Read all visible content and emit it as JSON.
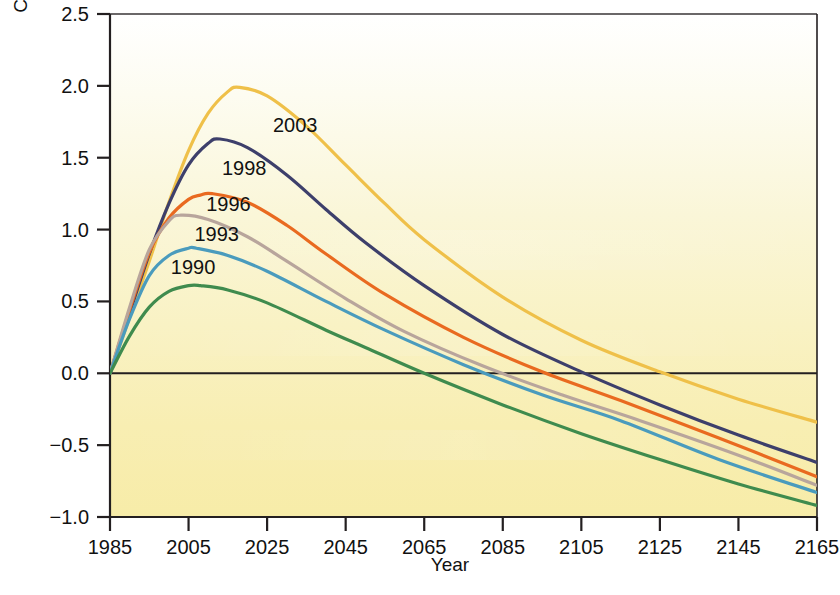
{
  "chart_data": {
    "type": "line",
    "title": "",
    "xlabel": "Year",
    "ylabel": "Concentration (parts per million)",
    "xlim": [
      1985,
      2165
    ],
    "ylim": [
      -1.0,
      2.5
    ],
    "grid": false,
    "legend_position": "inline-labels",
    "x_ticks": [
      "1985",
      "2005",
      "2025",
      "2045",
      "2065",
      "2085",
      "2105",
      "2125",
      "2145",
      "2165"
    ],
    "x_tick_values": [
      1985,
      2005,
      2025,
      2045,
      2065,
      2085,
      2105,
      2125,
      2145,
      2165
    ],
    "y_ticks": [
      "2.5",
      "2.0",
      "1.5",
      "1.0",
      "0.5",
      "0.0",
      "−0.5",
      "−1.0"
    ],
    "y_tick_values": [
      2.5,
      2.0,
      1.5,
      1.0,
      0.5,
      0.0,
      -0.5,
      -1.0
    ],
    "zero_line": 0.0,
    "series": [
      {
        "name": "2003",
        "label": "2003",
        "color": "#efc049",
        "peak_year": 2018,
        "peak_value": 1.99,
        "end_value": -0.34,
        "x": [
          1985,
          1990,
          1995,
          2000,
          2005,
          2010,
          2015,
          2018,
          2025,
          2035,
          2045,
          2055,
          2065,
          2085,
          2105,
          2125,
          2145,
          2165
        ],
        "values": [
          0.0,
          0.39,
          0.78,
          1.19,
          1.55,
          1.81,
          1.96,
          1.99,
          1.93,
          1.72,
          1.45,
          1.18,
          0.93,
          0.53,
          0.23,
          0.01,
          -0.18,
          -0.34
        ]
      },
      {
        "name": "1998",
        "label": "1998",
        "color": "#3d3f6b",
        "peak_year": 2013,
        "peak_value": 1.63,
        "end_value": -0.62,
        "x": [
          1985,
          1990,
          1995,
          2000,
          2005,
          2010,
          2013,
          2020,
          2030,
          2040,
          2050,
          2065,
          2085,
          2105,
          2125,
          2145,
          2165
        ],
        "values": [
          0.0,
          0.42,
          0.83,
          1.18,
          1.45,
          1.6,
          1.63,
          1.57,
          1.38,
          1.14,
          0.91,
          0.61,
          0.27,
          0.01,
          -0.22,
          -0.43,
          -0.62
        ]
      },
      {
        "name": "1996",
        "label": "1996",
        "color": "#e96a20",
        "peak_year": 2011,
        "peak_value": 1.25,
        "end_value": -0.72,
        "x": [
          1985,
          1990,
          1995,
          2000,
          2005,
          2008,
          2011,
          2020,
          2030,
          2040,
          2055,
          2075,
          2095,
          2115,
          2140,
          2165
        ],
        "values": [
          0.0,
          0.44,
          0.84,
          1.08,
          1.21,
          1.24,
          1.25,
          1.19,
          1.03,
          0.83,
          0.55,
          0.25,
          0.01,
          -0.19,
          -0.45,
          -0.72
        ]
      },
      {
        "name": "unlabeled-mauve",
        "label": "",
        "color": "#b8a59c",
        "peak_year": 2003,
        "peak_value": 1.1,
        "end_value": -0.78,
        "x": [
          1985,
          1990,
          1995,
          2000,
          2003,
          2010,
          2020,
          2030,
          2045,
          2060,
          2080,
          2100,
          2120,
          2145,
          2165
        ],
        "values": [
          0.0,
          0.46,
          0.86,
          1.06,
          1.1,
          1.07,
          0.95,
          0.78,
          0.52,
          0.29,
          0.05,
          -0.15,
          -0.33,
          -0.57,
          -0.78
        ]
      },
      {
        "name": "1993",
        "label": "1993",
        "color": "#4a9bbd",
        "peak_year": 2007,
        "peak_value": 0.87,
        "end_value": -0.83,
        "x": [
          1985,
          1990,
          1995,
          2000,
          2005,
          2007,
          2015,
          2025,
          2040,
          2055,
          2075,
          2095,
          2115,
          2140,
          2165
        ],
        "values": [
          0.0,
          0.38,
          0.68,
          0.82,
          0.87,
          0.87,
          0.82,
          0.71,
          0.5,
          0.3,
          0.06,
          -0.15,
          -0.33,
          -0.6,
          -0.83
        ]
      },
      {
        "name": "1990",
        "label": "1990",
        "color": "#3f8b4e",
        "peak_year": 2008,
        "peak_value": 0.61,
        "end_value": -0.92,
        "x": [
          1985,
          1990,
          1995,
          2000,
          2005,
          2008,
          2015,
          2025,
          2040,
          2050,
          2065,
          2085,
          2105,
          2125,
          2145,
          2165
        ],
        "values": [
          0.0,
          0.26,
          0.46,
          0.57,
          0.61,
          0.61,
          0.58,
          0.49,
          0.3,
          0.18,
          0.0,
          -0.22,
          -0.42,
          -0.6,
          -0.77,
          -0.92
        ]
      }
    ],
    "series_label_positions": [
      {
        "label": "2003",
        "x": 2027,
        "y": 1.72
      },
      {
        "label": "1998",
        "x": 2014,
        "y": 1.42
      },
      {
        "label": "1996",
        "x": 2010,
        "y": 1.17
      },
      {
        "label": "1993",
        "x": 2007,
        "y": 0.96
      },
      {
        "label": "1990",
        "x": 2001,
        "y": 0.73
      }
    ],
    "background": {
      "plot_top_color": "#fefefa",
      "plot_bottom_color": "#f7edae",
      "above_zero_tint": "#fcf8e0",
      "below_zero_tint": "#f8eeb0"
    },
    "axis_color": "#231f20"
  },
  "credit": ""
}
